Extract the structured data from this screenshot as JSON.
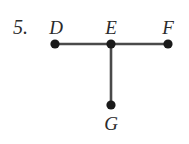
{
  "figure": {
    "problem_number": "5.",
    "background_color": "#ffffff",
    "stroke_color": "#4a4a4a",
    "vertex_color": "#1a1a1a",
    "text_color": "#2b2b2b",
    "vertices": [
      {
        "id": "D",
        "label": "D",
        "x": 55,
        "y": 44
      },
      {
        "id": "E",
        "label": "E",
        "x": 111,
        "y": 44
      },
      {
        "id": "F",
        "label": "F",
        "x": 168,
        "y": 44
      },
      {
        "id": "G",
        "label": "G",
        "x": 111,
        "y": 105
      }
    ],
    "segments": [
      {
        "id": "DE",
        "from": "D",
        "to": "E"
      },
      {
        "id": "EF",
        "from": "E",
        "to": "F"
      },
      {
        "id": "EG",
        "from": "E",
        "to": "G"
      }
    ],
    "labels": {
      "D": "D",
      "E": "E",
      "F": "F",
      "G": "G"
    }
  }
}
